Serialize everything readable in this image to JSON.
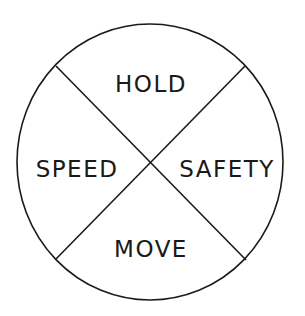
{
  "diagram": {
    "type": "quadrant-circle",
    "stroke_color": "#1a1a1a",
    "background_color": "#ffffff",
    "quadrants": {
      "top": {
        "label": "HOLD"
      },
      "left": {
        "label": "SPEED"
      },
      "right": {
        "label": "SAFETY"
      },
      "bottom": {
        "label": "MOVE"
      }
    }
  }
}
